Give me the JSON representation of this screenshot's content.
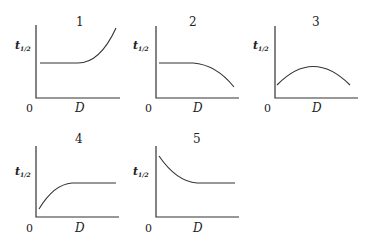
{
  "figure": {
    "panels": [
      {
        "label": "1",
        "ylabel": "t",
        "ysub": "1/2",
        "xlabel": "D",
        "origin": "0",
        "shape": "flat then rising"
      },
      {
        "label": "2",
        "ylabel": "t",
        "ysub": "1/2",
        "xlabel": "D",
        "origin": "0",
        "shape": "flat then falling"
      },
      {
        "label": "3",
        "ylabel": "t",
        "ysub": "1/2",
        "xlabel": "D",
        "origin": "0",
        "shape": "rise then fall (maximum)"
      },
      {
        "label": "4",
        "ylabel": "t",
        "ysub": "1/2",
        "xlabel": "D",
        "origin": "0",
        "shape": "rising then flat"
      },
      {
        "label": "5",
        "ylabel": "t",
        "ysub": "1/2",
        "xlabel": "D",
        "origin": "0",
        "shape": "falling then flat"
      }
    ]
  }
}
